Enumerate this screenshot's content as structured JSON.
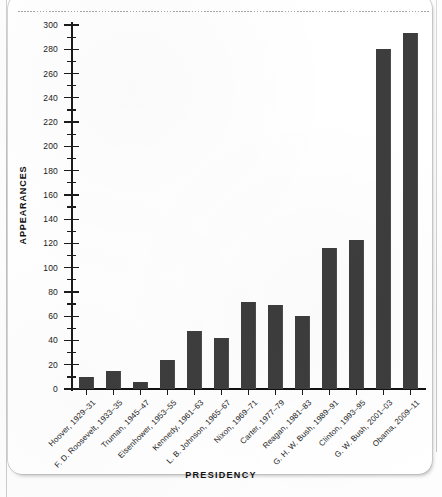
{
  "document": {
    "kind": "scanned-page-bar-chart"
  },
  "chart_data": {
    "type": "bar",
    "title": "",
    "xlabel": "PRESIDENCY",
    "ylabel": "APPEARANCES",
    "ylim": [
      0,
      300
    ],
    "ytick_step": 20,
    "yminor_step": 10,
    "grid": false,
    "legend": null,
    "bar_color": "#3d3d3d",
    "categories": [
      "Hoover, 1929–31",
      "F. D. Roosevelt, 1933–35",
      "Truman, 1945–47",
      "Eisenhower, 1953–55",
      "Kennedy, 1961–63",
      "L. B. Johnson, 1965–67",
      "Nixon, 1969–71",
      "Carter, 1977–79",
      "Reagan, 1981–83",
      "G. H. W. Bush, 1989–91",
      "Clinton, 1993–95",
      "G. W. Bush, 2001–03",
      "Obama, 2009–11"
    ],
    "values": [
      10,
      15,
      6,
      24,
      48,
      42,
      72,
      69,
      60,
      116,
      123,
      280,
      293
    ],
    "ytick_labels": [
      "0",
      "20",
      "40",
      "60",
      "80",
      "100",
      "120",
      "140",
      "160",
      "180",
      "200",
      "220",
      "240",
      "260",
      "280",
      "300"
    ],
    "ytick_values": [
      0,
      20,
      40,
      60,
      80,
      100,
      120,
      140,
      160,
      180,
      200,
      220,
      240,
      260,
      280,
      300
    ]
  }
}
